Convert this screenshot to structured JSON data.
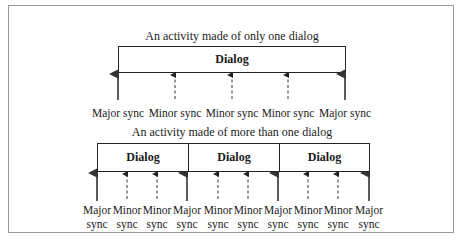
{
  "diagram": {
    "top": {
      "title": "An activity made of only one dialog",
      "dialogs": [
        "Dialog"
      ],
      "sync_points": [
        {
          "type": "major",
          "label": "Major sync"
        },
        {
          "type": "minor",
          "label": "Minor sync"
        },
        {
          "type": "minor",
          "label": "Minor sync"
        },
        {
          "type": "minor",
          "label": "Minor sync"
        },
        {
          "type": "major",
          "label": "Major sync"
        }
      ]
    },
    "bottom": {
      "title": "An activity made of more than one dialog",
      "dialogs": [
        "Dialog",
        "Dialog",
        "Dialog"
      ],
      "sync_points": [
        {
          "type": "major",
          "line1": "Major",
          "line2": "sync"
        },
        {
          "type": "minor",
          "line1": "Minor",
          "line2": "sync"
        },
        {
          "type": "minor",
          "line1": "Minor",
          "line2": "sync"
        },
        {
          "type": "major",
          "line1": "Major",
          "line2": "sync"
        },
        {
          "type": "minor",
          "line1": "Minor",
          "line2": "sync"
        },
        {
          "type": "minor",
          "line1": "Minor",
          "line2": "sync"
        },
        {
          "type": "major",
          "line1": "Major",
          "line2": "sync"
        },
        {
          "type": "minor",
          "line1": "Minor",
          "line2": "sync"
        },
        {
          "type": "minor",
          "line1": "Minor",
          "line2": "sync"
        },
        {
          "type": "major",
          "line1": "Major",
          "line2": "sync"
        }
      ]
    }
  }
}
